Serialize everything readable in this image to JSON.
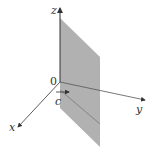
{
  "diagram": {
    "labels": {
      "z": "z",
      "y": "y",
      "x": "x",
      "origin": "0",
      "c": "c"
    },
    "colors": {
      "plane": "#a8a8a8",
      "axis": "#333333"
    }
  }
}
